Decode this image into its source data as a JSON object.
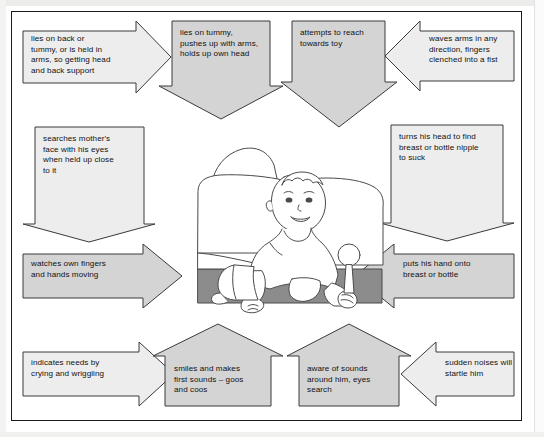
{
  "document": {
    "type": "developmental-milestones-diagram",
    "subject": "baby development chart",
    "frame_border_color": "#1b1b1b",
    "page_background": "#ffffff",
    "fill_gray": "#d4d4d4",
    "fill_light": "#ededed",
    "stroke_color": "#3a3a3a"
  },
  "illustration": {
    "caption": "line drawing of a baby sitting up on a bed with pillows, holding a rattle",
    "elements": [
      "baby",
      "pillow-left",
      "pillow-right",
      "rattle",
      "mattress",
      "blanket"
    ],
    "mattress_fill": "#8c8c8c"
  },
  "nodes": [
    {
      "id": "lies-on-back",
      "text": "lies on back or\ntummy, or is held in\narms, so getting head\nand back support",
      "shape": "arrow-right",
      "fill": "light"
    },
    {
      "id": "lies-on-tummy",
      "text": "lies on tummy,\npushes up with arms,\nholds up own head",
      "shape": "arrow-down",
      "fill": "gray"
    },
    {
      "id": "attempts-to-reach",
      "text": "attempts to reach\ntowards toy",
      "shape": "arrow-down",
      "fill": "gray"
    },
    {
      "id": "waves-arms",
      "text": "waves arms in any\ndirection, fingers\nclenched into a fist",
      "shape": "arrow-left",
      "fill": "light"
    },
    {
      "id": "searches-mothers-face",
      "text": "searches mother's\nface with his eyes\nwhen held up close\nto it",
      "shape": "arrow-down",
      "fill": "light"
    },
    {
      "id": "turns-his-head",
      "text": "turns his head to find\nbreast or bottle nipple\nto suck",
      "shape": "arrow-down",
      "fill": "light"
    },
    {
      "id": "watches-own-fingers",
      "text": "watches own fingers\nand hands moving",
      "shape": "arrow-right",
      "fill": "gray"
    },
    {
      "id": "puts-his-hand-onto",
      "text": "puts his hand onto\nbreast or bottle",
      "shape": "arrow-left",
      "fill": "gray"
    },
    {
      "id": "indicates-needs",
      "text": "indicates needs by\ncrying and wriggling",
      "shape": "arrow-right",
      "fill": "light"
    },
    {
      "id": "smiles-and-makes",
      "text": "smiles and makes\nfirst sounds – goos\nand coos",
      "shape": "arrow-up",
      "fill": "gray"
    },
    {
      "id": "aware-of-sounds",
      "text": "aware of sounds\naround him, eyes\nsearch",
      "shape": "arrow-up",
      "fill": "gray"
    },
    {
      "id": "sudden-noises",
      "text": "sudden noises will\nstartle him",
      "shape": "arrow-left",
      "fill": "light"
    }
  ]
}
